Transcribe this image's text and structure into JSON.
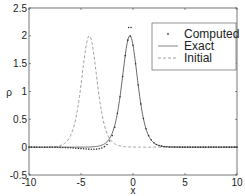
{
  "chart_data": {
    "type": "line",
    "title": "",
    "xlabel": "x",
    "ylabel": "ρ",
    "xlim": [
      -10,
      10
    ],
    "ylim": [
      -0.5,
      2.5
    ],
    "xticks": [
      -10,
      -5,
      0,
      5,
      10
    ],
    "xtick_labels": [
      "-10",
      "-5",
      "0",
      "5",
      "10"
    ],
    "yticks": [
      -0.5,
      0,
      0.5,
      1,
      1.5,
      2,
      2.5
    ],
    "ytick_labels": [
      "-0.5",
      "0",
      "0.5",
      "1",
      "1.5",
      "2",
      "2.5"
    ],
    "grid": false,
    "legend_position": "upper right",
    "legend": [
      "Computed",
      "Exact",
      "Initial"
    ],
    "series": [
      {
        "name": "Computed",
        "style": "markers",
        "profile": "2*sech^2(x - x0) with small oscillatory dip left of peak",
        "amplitude": 2.0,
        "center": -0.3,
        "left_tail_min": -0.05,
        "extra_marker_above_peak": 2.15
      },
      {
        "name": "Exact",
        "style": "solid",
        "profile": "2*sech^2(x - x0)",
        "amplitude": 2.0,
        "center": -0.3
      },
      {
        "name": "Initial",
        "style": "dashed",
        "profile": "2*sech^2(x - x0)",
        "amplitude": 2.0,
        "center": -4.2
      }
    ]
  }
}
